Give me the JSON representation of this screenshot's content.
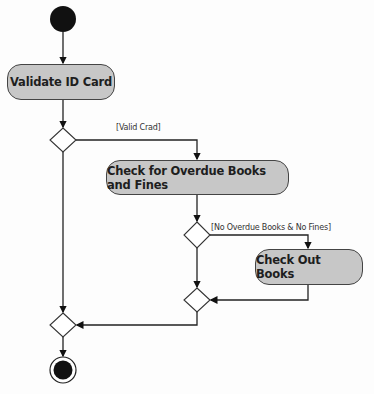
{
  "diagram": {
    "type": "UML activity diagram",
    "nodes": {
      "start": {
        "kind": "initial"
      },
      "validate": {
        "kind": "action",
        "label": "Validate ID Card"
      },
      "decision1": {
        "kind": "decision"
      },
      "check": {
        "kind": "action",
        "label": "Check for Overdue Books and Fines"
      },
      "decision2": {
        "kind": "decision"
      },
      "checkout": {
        "kind": "action",
        "label": "Check Out Books"
      },
      "merge1": {
        "kind": "merge"
      },
      "merge2": {
        "kind": "merge"
      },
      "end": {
        "kind": "final"
      }
    },
    "guards": {
      "valid_card": "[Valid Crad]",
      "no_overdue": "[No Overdue Books & No Fines]"
    },
    "edges": [
      {
        "from": "start",
        "to": "validate"
      },
      {
        "from": "validate",
        "to": "decision1"
      },
      {
        "from": "decision1",
        "to": "check",
        "guard": "[Valid Crad]"
      },
      {
        "from": "decision1",
        "to": "merge2"
      },
      {
        "from": "check",
        "to": "decision2"
      },
      {
        "from": "decision2",
        "to": "checkout",
        "guard": "[No Overdue Books & No Fines]"
      },
      {
        "from": "decision2",
        "to": "merge1"
      },
      {
        "from": "checkout",
        "to": "merge1"
      },
      {
        "from": "merge1",
        "to": "merge2"
      },
      {
        "from": "merge2",
        "to": "end"
      }
    ],
    "colors": {
      "action_fill": "#c7c7c7",
      "stroke": "#222222",
      "node_fill": "#111111"
    }
  }
}
